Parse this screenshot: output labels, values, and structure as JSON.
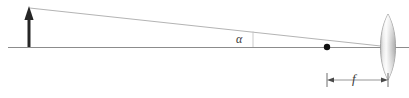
{
  "figure": {
    "type": "optics-ray-diagram",
    "width": 409,
    "height": 98,
    "background_color": "#ffffff"
  },
  "labels": {
    "angle": "α",
    "focal_length": "f"
  },
  "colors": {
    "axis": "#8c8c8c",
    "ray": "#b0b0b0",
    "object_arrow": "#262626",
    "focal_point": "#111111",
    "dimension_line": "#6e6e6e",
    "lens_stroke": "#9a9a9a",
    "lens_fill_light": "#f4f4f4",
    "lens_fill_mid": "#d6d6d6",
    "lens_fill_dark": "#b4b4b4",
    "alpha_text": "#3a3a3a"
  },
  "geometry": {
    "optical_axis": {
      "x1": 8,
      "y1": 47,
      "x2": 409,
      "y2": 47
    },
    "object_arrow": {
      "x": 29,
      "base_y": 47,
      "tip_y": 7,
      "head_width": 7,
      "head_height": 13,
      "shaft_width": 3
    },
    "chief_ray": {
      "x1": 29,
      "y1": 8,
      "x2": 390,
      "y2": 47
    },
    "angle_marker": {
      "x": 253,
      "y_top": 32,
      "y_bottom": 47
    },
    "focal_point": {
      "x": 327,
      "y": 47,
      "r": 3.2
    },
    "lens": {
      "cx": 388,
      "cy": 47,
      "half_height": 33,
      "half_width": 7.5
    },
    "focal_dimension": {
      "x1": 327,
      "x2": 388,
      "y": 80,
      "tick_half_height": 7
    }
  },
  "elements": [
    {
      "name": "optical-axis",
      "description": "horizontal optical axis line"
    },
    {
      "name": "object-arrow",
      "description": "upright object arrow at left"
    },
    {
      "name": "chief-ray",
      "description": "slanted ray from object tip to lens center"
    },
    {
      "name": "angle-alpha",
      "description": "field half-angle alpha between ray and axis"
    },
    {
      "name": "focal-point",
      "description": "black dot marking the focal point"
    },
    {
      "name": "lens",
      "description": "biconvex thin lens at right"
    },
    {
      "name": "focal-length-dimension",
      "description": "double headed arrow labelled f"
    }
  ]
}
